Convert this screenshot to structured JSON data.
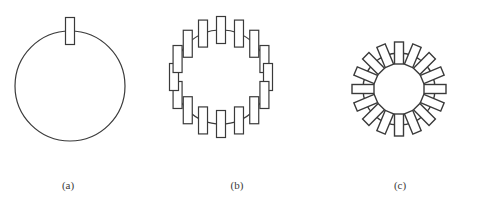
{
  "figure": {
    "width": 477,
    "height": 207,
    "background_color": "#ffffff",
    "stroke_color": "#3a3a3a",
    "caption_color": "#3a3a3a"
  },
  "panels": [
    {
      "id": "a",
      "caption": "(a)",
      "caption_x": 68,
      "caption_y": 186,
      "circle": {
        "cx": 70,
        "cy": 86,
        "r": 55,
        "stroke_width": 1.2
      },
      "rect_count": 1,
      "rect_width": 9,
      "rect_height": 27,
      "rect_stroke_width": 1.2,
      "rotate_with_angle": false,
      "start_angle_deg": -90,
      "angle_step_deg": 0,
      "radial_offset": 0
    },
    {
      "id": "b",
      "caption": "(b)",
      "caption_x": 237,
      "caption_y": 186,
      "circle": {
        "cx": 221,
        "cy": 77,
        "r": 47,
        "stroke_width": 1.2
      },
      "rect_count": 16,
      "rect_width": 9,
      "rect_height": 27,
      "rect_stroke_width": 1.2,
      "rotate_with_angle": false,
      "start_angle_deg": -90,
      "angle_step_deg": 22.5,
      "radial_offset": 0
    },
    {
      "id": "c",
      "caption": "(c)",
      "caption_x": 400,
      "caption_y": 186,
      "circle": {
        "cx": 399,
        "cy": 89,
        "r": 36,
        "stroke_width": 1.4
      },
      "rect_count": 16,
      "rect_width": 9,
      "rect_height": 22,
      "rect_stroke_width": 1.4,
      "rotate_with_angle": true,
      "start_angle_deg": -90,
      "angle_step_deg": 22.5,
      "radial_offset": 0
    }
  ]
}
